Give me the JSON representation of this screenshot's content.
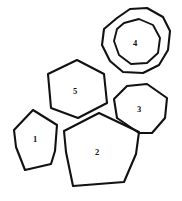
{
  "figure": {
    "background_color": "#ffffff",
    "stroke_color": "#111111",
    "width": 182,
    "height": 201
  },
  "shapes": [
    {
      "id": "shape-1",
      "label": "1",
      "kind": "pentagon",
      "label_x": 35,
      "label_y": 140,
      "path": "M 33 110 L 57 125 L 55 151 L 51 164 L 25 170 L 16 147 L 14 130 Z"
    },
    {
      "id": "shape-2",
      "label": "2",
      "kind": "pentagon",
      "label_x": 97,
      "label_y": 153,
      "path": "M 99 113 L 139 132 L 136 154 L 124 182 L 73 186 L 66 152 L 64 131 Z"
    },
    {
      "id": "shape-3",
      "label": "3",
      "kind": "heptagon",
      "label_x": 139,
      "label_y": 110,
      "path": "M 127 86 L 147 84 L 167 98 L 165 118 L 152 133 L 139 133 L 117 118 L 114 99 Z"
    },
    {
      "id": "shape-4-outer",
      "label": "",
      "kind": "blob-outer-ring",
      "label_x": 0,
      "label_y": 0,
      "path": "M 117 18 L 130 9 L 147 8 L 163 17 L 170 31 L 168 50 L 159 65 L 143 73 L 123 72 L 110 61 L 102 45 L 104 29 Z"
    },
    {
      "id": "shape-4",
      "label": "4",
      "kind": "blob-inner-ring",
      "label_x": 135,
      "label_y": 44,
      "path": "M 124 23 L 139 19 L 153 25 L 160 38 L 158 53 L 147 63 L 131 64 L 119 55 L 114 41 L 117 29 Z"
    },
    {
      "id": "shape-5",
      "label": "5",
      "kind": "hexagon",
      "label_x": 75,
      "label_y": 92,
      "path": "M 77 60 L 104 74 L 107 103 L 78 118 L 51 108 L 48 74 Z"
    }
  ]
}
